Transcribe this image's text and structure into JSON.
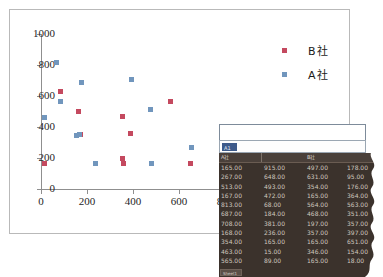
{
  "chart_data": {
    "type": "scatter",
    "title": "",
    "xlabel": "",
    "ylabel": "",
    "xlim": [
      0,
      800
    ],
    "ylim": [
      0,
      1000
    ],
    "xticks": [
      "0",
      "200",
      "400",
      "600",
      "800"
    ],
    "yticks": [
      "0",
      "200",
      "400",
      "600",
      "800",
      "1000"
    ],
    "grid": false,
    "legend_position": "top-right",
    "series": [
      {
        "name": "B社",
        "color": "#c4495f",
        "points": [
          [
            15,
            165
          ],
          [
            85,
            631
          ],
          [
            165,
            497
          ],
          [
            170,
            354
          ],
          [
            354,
            468
          ],
          [
            390,
            357
          ],
          [
            355,
            197
          ],
          [
            357,
            165
          ],
          [
            565,
            564
          ],
          [
            650,
            165
          ]
        ]
      },
      {
        "name": "A社",
        "color": "#7196bd",
        "points": [
          [
            15,
            463
          ],
          [
            68,
            813
          ],
          [
            85,
            565
          ],
          [
            155,
            346
          ],
          [
            167,
            354
          ],
          [
            175,
            687
          ],
          [
            237,
            165
          ],
          [
            395,
            708
          ],
          [
            478,
            513
          ],
          [
            480,
            165
          ],
          [
            655,
            267
          ]
        ]
      }
    ]
  },
  "legend": {
    "items": [
      {
        "label": "B社",
        "color": "#c4495f"
      },
      {
        "label": "A社",
        "color": "#7196bd"
      }
    ]
  },
  "spreadsheet": {
    "name_box": "A1",
    "formula_value": "",
    "sheet_tab": "Sheet1",
    "headers": [
      "A社",
      "",
      "B社",
      ""
    ],
    "rows": [
      [
        "165.00",
        "915.00",
        "497.00",
        "178.00"
      ],
      [
        "267.00",
        "648.00",
        "631.00",
        "95.00"
      ],
      [
        "513.00",
        "493.00",
        "354.00",
        "176.00"
      ],
      [
        "167.00",
        "472.00",
        "165.00",
        "364.00"
      ],
      [
        "813.00",
        "68.00",
        "564.00",
        "563.00"
      ],
      [
        "687.00",
        "184.00",
        "468.00",
        "351.00"
      ],
      [
        "708.00",
        "381.00",
        "197.00",
        "357.00"
      ],
      [
        "168.00",
        "236.00",
        "357.00",
        "397.00"
      ],
      [
        "354.00",
        "165.00",
        "165.00",
        "651.00"
      ],
      [
        "463.00",
        "15.00",
        "346.00",
        "154.00"
      ],
      [
        "565.00",
        "89.00",
        "165.00",
        "18.00"
      ]
    ]
  }
}
